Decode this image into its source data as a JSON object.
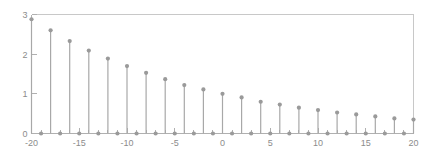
{
  "chart_data": {
    "type": "scatter",
    "subtype": "stem",
    "title": "",
    "subtitle": "",
    "xlabel": "",
    "ylabel": "",
    "xlim": [
      -20,
      20
    ],
    "ylim": [
      0,
      3
    ],
    "grid": false,
    "legend": null,
    "legend_position": "none",
    "xticks": [
      -20,
      -15,
      -10,
      -5,
      0,
      5,
      10,
      15,
      20
    ],
    "xtick_labels": [
      "-20",
      "-15",
      "-10",
      "-5",
      "0",
      "5",
      "10",
      "15",
      "20"
    ],
    "xminor_ticks": [
      -19,
      -18,
      -17,
      -16,
      -14,
      -13,
      -12,
      -11,
      -9,
      -8,
      -7,
      -6,
      -4,
      -3,
      -2,
      -1,
      1,
      2,
      3,
      4,
      6,
      7,
      8,
      9,
      11,
      12,
      13,
      14,
      16,
      17,
      18,
      19
    ],
    "yticks": [
      0,
      1,
      2,
      3
    ],
    "ytick_labels": [
      "0",
      "1",
      "2",
      "3"
    ],
    "marker": "circle",
    "marker_color": "#9a9a9a",
    "stem_color": "#a8a8a8",
    "baseline_color": "#b0b0b0",
    "x": [
      -20,
      -19,
      -18,
      -17,
      -16,
      -15,
      -14,
      -13,
      -12,
      -11,
      -10,
      -9,
      -8,
      -7,
      -6,
      -5,
      -4,
      -3,
      -2,
      -1,
      0,
      1,
      2,
      3,
      4,
      5,
      6,
      7,
      8,
      9,
      10,
      11,
      12,
      13,
      14,
      15,
      16,
      17,
      18,
      19,
      20
    ],
    "values": [
      2.88,
      0.0,
      2.6,
      0.0,
      2.33,
      0.0,
      2.09,
      0.0,
      1.89,
      0.0,
      1.7,
      0.0,
      1.53,
      0.0,
      1.37,
      0.0,
      1.22,
      0.0,
      1.11,
      0.0,
      1.0,
      0.0,
      0.91,
      0.0,
      0.8,
      0.0,
      0.73,
      0.0,
      0.65,
      0.0,
      0.59,
      0.0,
      0.53,
      0.0,
      0.48,
      0.0,
      0.43,
      0.0,
      0.38,
      0.0,
      0.35
    ]
  },
  "figure": {
    "background_color": "#ffffff",
    "axes_color": "#b0b0b0",
    "text_color": "#8c8c8c"
  }
}
